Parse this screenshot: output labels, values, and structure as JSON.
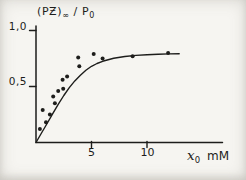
{
  "title_parts": {
    "group": "(PƵ)",
    "infinity": "∞",
    "ratio": " / P",
    "p_sub": "0"
  },
  "xlabel_parts": {
    "symbol": "x",
    "sub": "0",
    "unit": "mM"
  },
  "chart_data": {
    "type": "scatter",
    "title": "(PƵ)∞ / P0",
    "xlabel": "x0 (mM)",
    "ylabel": "(PƵ)∞ / P0",
    "points": [
      [
        0.35,
        0.12
      ],
      [
        0.6,
        0.29
      ],
      [
        0.9,
        0.18
      ],
      [
        1.25,
        0.25
      ],
      [
        1.7,
        0.35
      ],
      [
        1.55,
        0.41
      ],
      [
        2.0,
        0.46
      ],
      [
        2.45,
        0.48
      ],
      [
        2.4,
        0.56
      ],
      [
        2.8,
        0.59
      ],
      [
        3.9,
        0.68
      ],
      [
        3.8,
        0.76
      ],
      [
        5.2,
        0.79
      ],
      [
        6.0,
        0.75
      ],
      [
        8.7,
        0.77
      ],
      [
        11.9,
        0.8
      ]
    ],
    "curve": [
      [
        0,
        0
      ],
      [
        0.5,
        0.085
      ],
      [
        1,
        0.17
      ],
      [
        1.5,
        0.255
      ],
      [
        2,
        0.34
      ],
      [
        2.5,
        0.42
      ],
      [
        3,
        0.49
      ],
      [
        3.5,
        0.55
      ],
      [
        4,
        0.6
      ],
      [
        4.5,
        0.645
      ],
      [
        5,
        0.68
      ],
      [
        5.5,
        0.705
      ],
      [
        6,
        0.725
      ],
      [
        7,
        0.752
      ],
      [
        8,
        0.768
      ],
      [
        9,
        0.778
      ],
      [
        10,
        0.784
      ],
      [
        11,
        0.788
      ],
      [
        12,
        0.791
      ],
      [
        12.9,
        0.793
      ]
    ],
    "xlim": [
      0,
      16.8
    ],
    "ylim": [
      0,
      1.04
    ],
    "xticks": [
      5,
      10
    ],
    "xtick_labels": [
      "5",
      "10"
    ],
    "yticks": [
      1.0,
      0.5
    ],
    "ytick_labels": [
      "1,0",
      "0,5"
    ],
    "grid": false,
    "legend": "none",
    "ink_color": "#1d1d1b",
    "paper_color": "#f6f5f1"
  }
}
